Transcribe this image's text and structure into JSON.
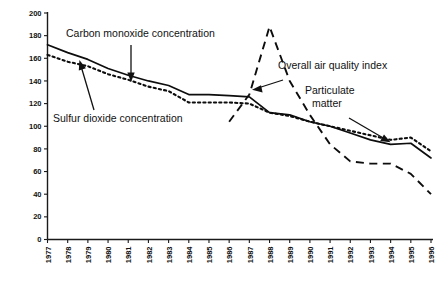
{
  "chart_data": {
    "type": "line",
    "title": "",
    "xlabel": "",
    "ylabel": "",
    "ylim": [
      0,
      200
    ],
    "y_ticks": [
      0,
      20,
      40,
      60,
      80,
      100,
      120,
      140,
      160,
      180,
      200
    ],
    "grid": false,
    "legend_position": "inline-annotations",
    "x": [
      1977,
      1978,
      1979,
      1980,
      1981,
      1982,
      1983,
      1984,
      1985,
      1986,
      1987,
      1988,
      1989,
      1990,
      1991,
      1992,
      1993,
      1994,
      1995,
      1996
    ],
    "categories": [
      "1977",
      "1978",
      "1979",
      "1980",
      "1981",
      "1982",
      "1983",
      "1984",
      "1985",
      "1986",
      "1987",
      "1988",
      "1989",
      "1990",
      "1991",
      "1992",
      "1993",
      "1994",
      "1995",
      "1996"
    ],
    "series": [
      {
        "name": "Carbon monoxide concentration",
        "style": "solid",
        "values": [
          172,
          165,
          159,
          151,
          145,
          140,
          136,
          128,
          128,
          127,
          126,
          112,
          110,
          104,
          100,
          94,
          88,
          84,
          85,
          72
        ]
      },
      {
        "name": "Sulfur dioxide concentration",
        "style": "dotted",
        "values": [
          163,
          157,
          153,
          146,
          141,
          135,
          131,
          121,
          121,
          121,
          120,
          112,
          109,
          104,
          100,
          96,
          92,
          88,
          90,
          78
        ]
      },
      {
        "name": "Overall air quality index",
        "style": "dashed",
        "values": [
          null,
          null,
          null,
          null,
          null,
          null,
          null,
          null,
          null,
          104,
          128,
          188,
          140,
          110,
          84,
          69,
          67,
          67,
          58,
          40
        ]
      }
    ],
    "annotations": [
      {
        "label": "Carbon monoxide concentration",
        "points_to_series": "Carbon monoxide concentration"
      },
      {
        "label": "Sulfur dioxide concentration",
        "points_to_series": "Sulfur dioxide concentration"
      },
      {
        "label": "Overall air quality index",
        "points_to_series": "Overall air quality index"
      },
      {
        "label": "Particulate matter",
        "points_to_series": "Sulfur dioxide concentration"
      }
    ]
  },
  "annotation_labels": {
    "carbon_monoxide": "Carbon monoxide concentration",
    "sulfur_dioxide": "Sulfur dioxide concentration",
    "air_quality_index": "Overall air quality index",
    "particulate_matter_line1": "Particulate",
    "particulate_matter_line2": "matter"
  },
  "axes": {
    "y_tick_labels": [
      "200",
      "180",
      "160",
      "140",
      "120",
      "100",
      "80",
      "60",
      "40",
      "20",
      "0"
    ],
    "x_tick_labels": [
      "1977",
      "1978",
      "1979",
      "1980",
      "1981",
      "1982",
      "1983",
      "1984",
      "1985",
      "1986",
      "1987",
      "1988",
      "1989",
      "1990",
      "1991",
      "1992",
      "1993",
      "1994",
      "1995",
      "1996"
    ]
  },
  "colors": {
    "ink": "#0d0d0d",
    "background": "#ffffff"
  }
}
